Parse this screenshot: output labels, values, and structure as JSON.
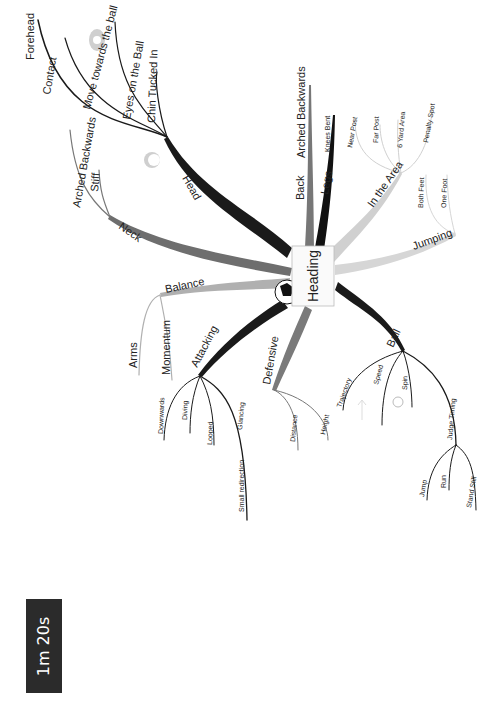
{
  "timer": {
    "label": "1m 20s"
  },
  "central": {
    "label": "Heading"
  },
  "colors": {
    "dark": "#1a1a1a",
    "mid": "#6e6e6e",
    "light": "#b8b8b8",
    "pale": "#d8d8d8"
  },
  "branches": {
    "head": {
      "label": "Head",
      "children": [
        "Contact",
        "Forehead",
        "Move towards the ball",
        "Eyes on the Ball",
        "Chin Tucked In"
      ]
    },
    "neck": {
      "label": "Neck",
      "children": [
        "Arched Backwards",
        "Stiff"
      ]
    },
    "balance": {
      "label": "Balance",
      "children": [
        "Arms",
        "Momentum"
      ]
    },
    "attacking": {
      "label": "Attacking",
      "children": [
        "Downwards",
        "Diving",
        "Looped",
        "Glancing",
        "Small redirection"
      ]
    },
    "defensive": {
      "label": "Defensive",
      "children": [
        "Distance",
        "Height"
      ]
    },
    "ball": {
      "label": "Ball",
      "children": [
        "Trajectory",
        "Speed",
        "Spin",
        "Judge Timing"
      ]
    },
    "judge_timing": {
      "label": "Judge Timing",
      "children": [
        "Jump",
        "Run",
        "Stand Still"
      ]
    },
    "back": {
      "label": "Back",
      "children": [
        "Arched Backwards"
      ]
    },
    "legs": {
      "label": "Legs",
      "children": [
        "Knees Bent"
      ]
    },
    "in_the_area": {
      "label": "In the Area",
      "children": [
        "Near Post",
        "Far Post",
        "6 Yard Area",
        "Penalty Spot"
      ]
    },
    "jumping": {
      "label": "Jumping",
      "children": [
        "Both Feet",
        "One Foot"
      ]
    }
  }
}
